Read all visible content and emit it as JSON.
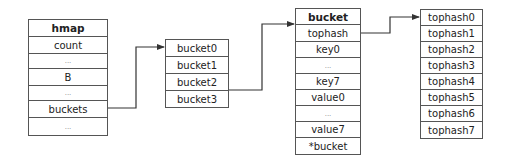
{
  "hmap": {
    "rows": [
      {
        "label": "hmap",
        "type": "title",
        "h": 17
      },
      {
        "label": "count",
        "type": "field",
        "h": 17
      },
      {
        "label": "...",
        "type": "dots",
        "h": 15
      },
      {
        "label": "B",
        "type": "field",
        "h": 17
      },
      {
        "label": "...",
        "type": "dots",
        "h": 15
      },
      {
        "label": "buckets",
        "type": "field",
        "h": 17
      },
      {
        "label": "...",
        "type": "dots",
        "h": 18
      }
    ]
  },
  "buckets_array": {
    "rows": [
      {
        "label": "bucket0"
      },
      {
        "label": "bucket1"
      },
      {
        "label": "bucket2"
      },
      {
        "label": "bucket3"
      }
    ]
  },
  "bucket": {
    "rows": [
      {
        "label": "bucket",
        "type": "title"
      },
      {
        "label": "tophash",
        "type": "field"
      },
      {
        "label": "key0",
        "type": "field"
      },
      {
        "label": "...",
        "type": "dots"
      },
      {
        "label": "key7",
        "type": "field"
      },
      {
        "label": "value0",
        "type": "field"
      },
      {
        "label": "...",
        "type": "dots"
      },
      {
        "label": "value7",
        "type": "field"
      },
      {
        "label": "*bucket",
        "type": "field"
      }
    ]
  },
  "tophash_array": {
    "rows": [
      {
        "label": "tophash0"
      },
      {
        "label": "tophash1"
      },
      {
        "label": "tophash2"
      },
      {
        "label": "tophash3"
      },
      {
        "label": "tophash4"
      },
      {
        "label": "tophash5"
      },
      {
        "label": "tophash6"
      },
      {
        "label": "tophash7"
      }
    ]
  },
  "arrows": [
    {
      "from": "hmap.buckets",
      "to": "buckets_array.bucket0"
    },
    {
      "from": "buckets_array.bucket2",
      "to": "bucket"
    },
    {
      "from": "bucket.tophash",
      "to": "tophash_array.tophash0"
    }
  ],
  "colors": {
    "line": "#333333",
    "border": "#555555"
  }
}
